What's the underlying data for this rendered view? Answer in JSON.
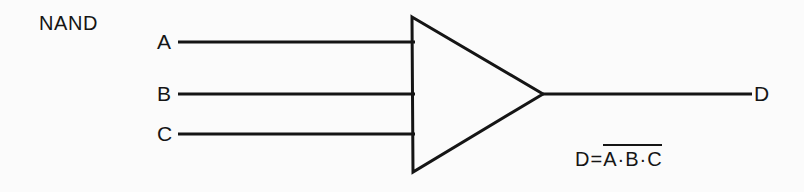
{
  "diagram": {
    "title": "NAND",
    "gate_type": "nand-gate",
    "shape": "triangle-with-inversion-implied",
    "stroke_color": "#151515",
    "background_color": "#fbfbfb",
    "inputs": [
      {
        "label": "A",
        "wire_y": 42
      },
      {
        "label": "B",
        "wire_y": 94
      },
      {
        "label": "C",
        "wire_y": 134
      }
    ],
    "output": {
      "label": "D",
      "wire_y": 94
    },
    "equation": {
      "lhs": "D",
      "operator": "=",
      "operands": [
        "A",
        "B",
        "C"
      ],
      "operand_separator": "·",
      "negated": true,
      "full_text": "D = A·B·C (complemented)"
    },
    "geometry": {
      "triangle_top_left_x": 412,
      "triangle_top_left_y": 17,
      "triangle_bottom_left_x": 413,
      "triangle_bottom_left_y": 172,
      "triangle_apex_x": 543,
      "triangle_apex_y": 94,
      "input_wire_start_x": 178,
      "input_wire_end_x": 415,
      "output_wire_start_x": 543,
      "output_wire_end_x": 752
    }
  }
}
